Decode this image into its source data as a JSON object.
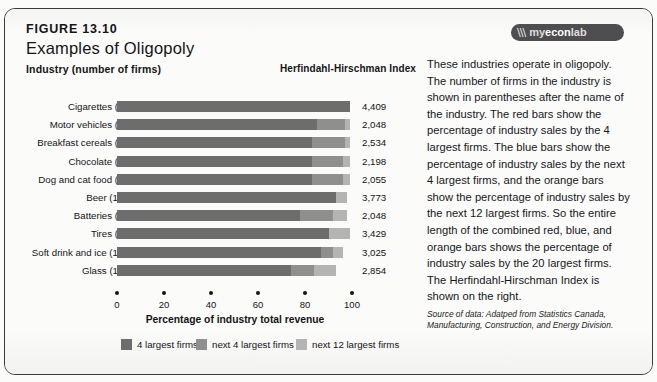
{
  "figure": {
    "number": "FIGURE 13.10",
    "title": "Examples of Oligopoly",
    "logo_mark": "\\\\\\",
    "logo_prefix": "my",
    "logo_mid": "econ",
    "logo_suffix": "lab"
  },
  "columns": {
    "industry_header": "Industry (number of firms)",
    "hhi_header": "Herfindahl-Hirschman Index"
  },
  "legend": [
    {
      "label": "4 largest firms",
      "color": "#6d6d6d"
    },
    {
      "label": "next 4 largest firms",
      "color": "#8f8f8f"
    },
    {
      "label": "next 12 largest firms",
      "color": "#b4b4b4"
    }
  ],
  "axis": {
    "title": "Percentage of industry total revenue",
    "ticks": [
      "0",
      "20",
      "40",
      "60",
      "80",
      "100"
    ],
    "min": 0,
    "max": 100
  },
  "sidebar": {
    "body": "These industries operate in oligopoly. The number of firms in the industry is shown in parentheses after the name of the industry. The red bars show the percentage of industry sales by the 4 largest firms. The blue bars show the percentage of industry sales by the next 4 largest firms, and the orange bars show the percentage of industry sales by the next 12 largest firms. So the entire length of the combined red, blue, and orange bars shows the percentage of industry sales by the 20 largest firms. The Herfindahl-Hirschman Index is shown on the right.",
    "source_label": "Source of data:",
    "source_text": " Adatped from Statistics Canada, Manufacturing, Construction, and Energy Division."
  },
  "chart_data": {
    "type": "bar",
    "orientation": "horizontal",
    "stacked": true,
    "title": "Examples of Oligopoly",
    "xlabel": "Percentage of industry total revenue",
    "ylabel": "Industry (number of firms)",
    "xlim": [
      0,
      100
    ],
    "grid": false,
    "legend_position": "bottom",
    "categories": [
      "Cigarettes (14)",
      "Motor vehicles (50)",
      "Breakfast cereals (25)",
      "Chocolate (32)",
      "Dog and cat food (38)",
      "Beer (104)",
      "Batteries (30)",
      "Tires (65)",
      "Soft drink and ice (157)",
      "Glass (105)"
    ],
    "series": [
      {
        "name": "4 largest firms",
        "color": "#6d6d6d",
        "values": [
          99,
          85,
          83,
          83,
          83,
          93,
          78,
          90,
          87,
          74
        ]
      },
      {
        "name": "next 4 largest firms",
        "color": "#8f8f8f",
        "values": [
          0,
          12,
          14,
          13,
          13,
          0,
          14,
          0,
          5,
          10
        ]
      },
      {
        "name": "next 12 largest firms",
        "color": "#b4b4b4",
        "values": [
          0,
          2,
          2,
          3,
          3,
          5,
          6,
          9,
          4,
          9
        ]
      }
    ],
    "annotations_label": "Herfindahl-Hirschman Index",
    "annotations": [
      "4,409",
      "2,048",
      "2,534",
      "2,198",
      "2,055",
      "3,773",
      "2,048",
      "3,429",
      "3,025",
      "2,854"
    ]
  }
}
